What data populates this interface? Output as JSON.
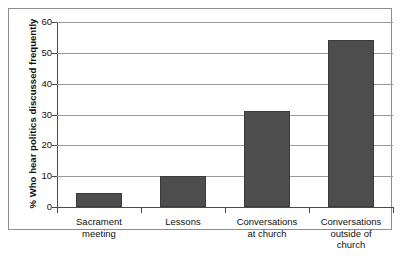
{
  "chart_data": {
    "type": "bar",
    "title": "",
    "xlabel": "",
    "ylabel": "% Who hear politics discussed frequently",
    "ylim": [
      0,
      60
    ],
    "grid": true,
    "legend": "none",
    "categories": [
      "Sacrament meeting",
      "Lessons",
      "Conversations at church",
      "Conversations outside of church"
    ],
    "values": [
      4.5,
      10,
      31,
      54
    ],
    "ytick_labels": [
      "0",
      "10",
      "20",
      "30",
      "40",
      "50",
      "60"
    ],
    "ytick_values": [
      0,
      10,
      20,
      30,
      40,
      50,
      60
    ],
    "bar_color": "#4d4d4d",
    "gridline_color": "#9a9a9a",
    "axis_color": "#4a4a4a",
    "background_color": "#ffffff"
  },
  "axes": {
    "y_title": "% Who hear politics discussed frequently"
  },
  "x_labels": [
    {
      "line1": "Sacrament",
      "line2": "meeting",
      "line3": ""
    },
    {
      "line1": "Lessons",
      "line2": "",
      "line3": ""
    },
    {
      "line1": "Conversations",
      "line2": "at church",
      "line3": ""
    },
    {
      "line1": "Conversations",
      "line2": "outside of",
      "line3": "church"
    }
  ]
}
